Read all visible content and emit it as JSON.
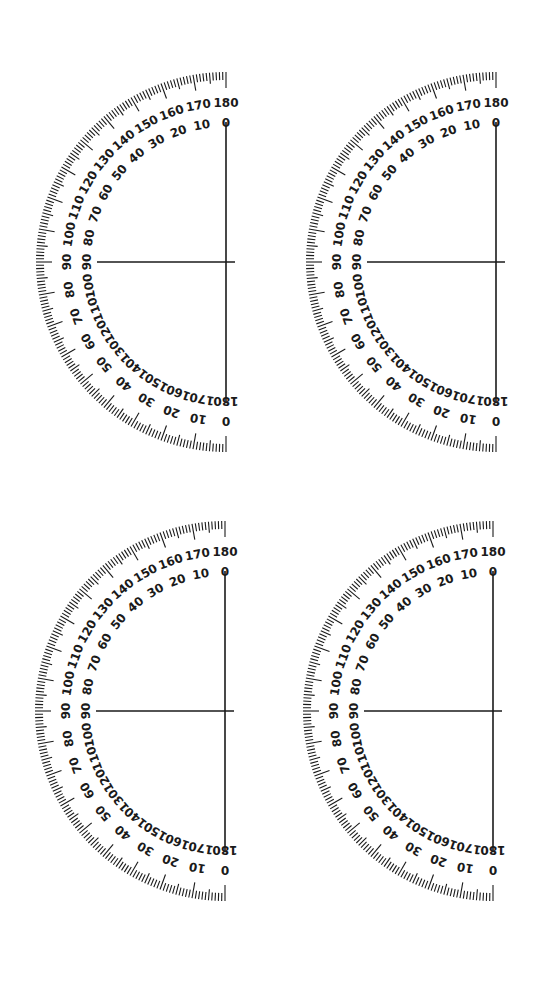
{
  "page": {
    "background": "#ffffff",
    "ink_color": "#1a1a1a"
  },
  "protractor_template": {
    "outer_radius": 190,
    "tick_step_degrees": 1,
    "tick_length_minor": 8,
    "tick_length_mid": 11,
    "tick_length_major": 16,
    "outer_scale_radius": 159,
    "inner_scale_radius": 139,
    "outer_scale_labels": [
      "180",
      "170",
      "160",
      "150",
      "140",
      "130",
      "120",
      "110",
      "100",
      "90",
      "80",
      "70",
      "60",
      "50",
      "40",
      "30",
      "20",
      "10",
      "0"
    ],
    "inner_scale_labels": [
      "0",
      "10",
      "20",
      "30",
      "40",
      "50",
      "60",
      "70",
      "80",
      "90",
      "100",
      "110",
      "120",
      "130",
      "140",
      "150",
      "160",
      "170",
      "180"
    ],
    "baseline_inset": 20,
    "horizontal_line_start_radius": 129,
    "horizontal_line_overshoot": 9
  },
  "protractors": [
    {
      "id": "top-left",
      "cx": 226,
      "cy": 262
    },
    {
      "id": "top-right",
      "cx": 496,
      "cy": 262
    },
    {
      "id": "bottom-left",
      "cx": 225,
      "cy": 711
    },
    {
      "id": "bottom-right",
      "cx": 493,
      "cy": 711
    }
  ]
}
